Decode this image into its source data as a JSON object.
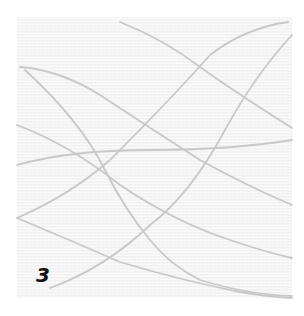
{
  "panel": {
    "label": "3",
    "background_color": "#f4f4f4",
    "stroke_color": "#c8c8c8"
  }
}
